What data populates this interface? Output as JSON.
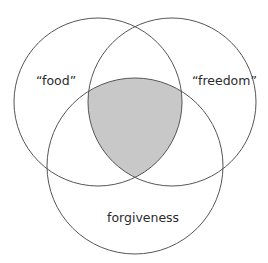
{
  "diagram": {
    "type": "venn",
    "sets": [
      {
        "id": "food",
        "label": "“food”",
        "cx": 98,
        "cy": 102,
        "r": 84
      },
      {
        "id": "freedom",
        "label": "“freedom”",
        "cx": 172,
        "cy": 102,
        "r": 84
      },
      {
        "id": "forgiveness",
        "label": "forgiveness",
        "cx": 135,
        "cy": 166,
        "r": 88
      }
    ],
    "highlighted_region": "intersection of all three sets",
    "colors": {
      "background": "#ffffff",
      "stroke": "#555555",
      "shade": "#c8c8c8",
      "text": "#2b2b2b"
    }
  }
}
